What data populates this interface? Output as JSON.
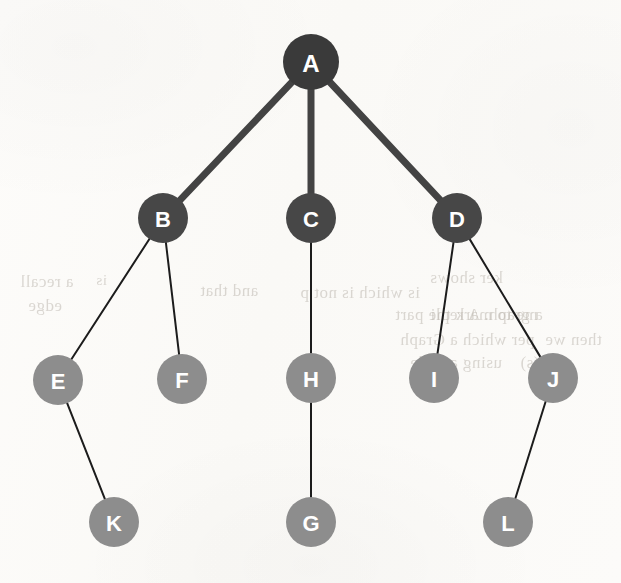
{
  "figure": {
    "type": "tree-diagram",
    "background_color": "#fbfaf7",
    "width": 621,
    "height": 583
  },
  "palette": {
    "root_fill": "#3a3a3a",
    "level1_fill": "#474747",
    "leaf_fill": "#8d8d8d",
    "label_color": "#ffffff",
    "thick_edge_color": "#434343",
    "thin_edge_color": "#1c1c1c"
  },
  "graph": {
    "node_count": 12,
    "edge_count": 11,
    "root": "A",
    "nodes": [
      {
        "id": "A",
        "label": "A",
        "cx": 311,
        "cy": 62,
        "r": 28,
        "fill": "#3a3a3a",
        "font_size": 24,
        "level": 0
      },
      {
        "id": "B",
        "label": "B",
        "cx": 163,
        "cy": 218,
        "r": 25,
        "fill": "#474747",
        "font_size": 22,
        "level": 1
      },
      {
        "id": "C",
        "label": "C",
        "cx": 311,
        "cy": 218,
        "r": 25,
        "fill": "#474747",
        "font_size": 22,
        "level": 1
      },
      {
        "id": "D",
        "label": "D",
        "cx": 457,
        "cy": 218,
        "r": 25,
        "fill": "#474747",
        "font_size": 22,
        "level": 1
      },
      {
        "id": "E",
        "label": "E",
        "cx": 58,
        "cy": 380,
        "r": 25,
        "fill": "#8d8d8d",
        "font_size": 22,
        "level": 2
      },
      {
        "id": "F",
        "label": "F",
        "cx": 182,
        "cy": 379,
        "r": 25,
        "fill": "#8d8d8d",
        "font_size": 22,
        "level": 2
      },
      {
        "id": "H",
        "label": "H",
        "cx": 311,
        "cy": 378,
        "r": 25,
        "fill": "#8d8d8d",
        "font_size": 22,
        "level": 2
      },
      {
        "id": "I",
        "label": "I",
        "cx": 434,
        "cy": 378,
        "r": 25,
        "fill": "#8d8d8d",
        "font_size": 22,
        "level": 2
      },
      {
        "id": "J",
        "label": "J",
        "cx": 553,
        "cy": 378,
        "r": 25,
        "fill": "#8d8d8d",
        "font_size": 22,
        "level": 2
      },
      {
        "id": "K",
        "label": "K",
        "cx": 114,
        "cy": 522,
        "r": 25,
        "fill": "#8d8d8d",
        "font_size": 22,
        "level": 3
      },
      {
        "id": "G",
        "label": "G",
        "cx": 311,
        "cy": 522,
        "r": 25,
        "fill": "#8d8d8d",
        "font_size": 22,
        "level": 3
      },
      {
        "id": "L",
        "label": "L",
        "cx": 508,
        "cy": 522,
        "r": 25,
        "fill": "#8d8d8d",
        "font_size": 22,
        "level": 3
      }
    ],
    "edges": [
      {
        "from": "A",
        "to": "B",
        "width": 7,
        "color": "#434343"
      },
      {
        "from": "A",
        "to": "C",
        "width": 7,
        "color": "#434343"
      },
      {
        "from": "A",
        "to": "D",
        "width": 7,
        "color": "#434343"
      },
      {
        "from": "B",
        "to": "E",
        "width": 2,
        "color": "#1c1c1c"
      },
      {
        "from": "B",
        "to": "F",
        "width": 2,
        "color": "#1c1c1c"
      },
      {
        "from": "C",
        "to": "H",
        "width": 2,
        "color": "#1c1c1c"
      },
      {
        "from": "D",
        "to": "I",
        "width": 2,
        "color": "#1c1c1c"
      },
      {
        "from": "D",
        "to": "J",
        "width": 2,
        "color": "#1c1c1c"
      },
      {
        "from": "E",
        "to": "K",
        "width": 2,
        "color": "#1c1c1c"
      },
      {
        "from": "H",
        "to": "G",
        "width": 2,
        "color": "#1c1c1c"
      },
      {
        "from": "J",
        "to": "L",
        "width": 2,
        "color": "#1c1c1c"
      }
    ]
  },
  "bleed_through_text": [
    {
      "text": "ker shows",
      "x": 430,
      "y": 268,
      "size": 17
    },
    {
      "text": "and that",
      "x": 200,
      "y": 281,
      "size": 17
    },
    {
      "text": "is which is not p",
      "x": 300,
      "y": 283,
      "size": 17
    },
    {
      "text": "me to mark the part",
      "x": 395,
      "y": 305,
      "size": 17
    },
    {
      "text": "a graph. A repli",
      "x": 430,
      "y": 305,
      "size": 17
    },
    {
      "text": "per which a Graph",
      "x": 400,
      "y": 330,
      "size": 17
    },
    {
      "text": "then we",
      "x": 545,
      "y": 330,
      "size": 17
    },
    {
      "text": "using a node",
      "x": 410,
      "y": 353,
      "size": 17
    },
    {
      "text": "(s)",
      "x": 520,
      "y": 353,
      "size": 17
    },
    {
      "text": "a recall",
      "x": 20,
      "y": 272,
      "size": 17
    },
    {
      "text": "edge",
      "x": 28,
      "y": 296,
      "size": 17
    },
    {
      "text": "is",
      "x": 96,
      "y": 272,
      "size": 15
    }
  ]
}
